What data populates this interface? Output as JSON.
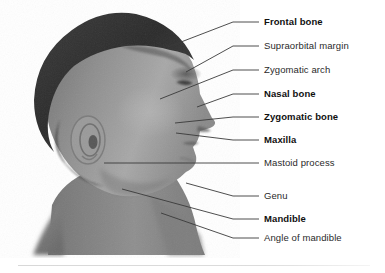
{
  "figure": {
    "photo_alt": "male-head-right-profile-grayscale"
  },
  "labels": [
    {
      "id": "frontal-bone",
      "text": "Frontal bone",
      "weight": "bold",
      "y": 22,
      "line": {
        "x1": 168,
        "y1": 47,
        "x2": 233,
        "y2": 22,
        "x3": 259,
        "y3": 22
      }
    },
    {
      "id": "supraorbital-margin",
      "text": "Supraorbital margin",
      "weight": "regular",
      "y": 46,
      "line": {
        "x1": 186,
        "y1": 72,
        "x2": 233,
        "y2": 46,
        "x3": 259,
        "y3": 46
      }
    },
    {
      "id": "zygomatic-arch",
      "text": "Zygomatic arch",
      "weight": "regular",
      "y": 70,
      "line": {
        "x1": 160,
        "y1": 99,
        "x2": 233,
        "y2": 70,
        "x3": 259,
        "y3": 70
      }
    },
    {
      "id": "nasal-bone",
      "text": "Nasal bone",
      "weight": "bold",
      "y": 94,
      "line": {
        "x1": 197,
        "y1": 107,
        "x2": 233,
        "y2": 94,
        "x3": 259,
        "y3": 94
      }
    },
    {
      "id": "zygomatic-bone",
      "text": "Zygomatic bone",
      "weight": "bold",
      "y": 117,
      "line": {
        "x1": 175,
        "y1": 123,
        "x2": 233,
        "y2": 117,
        "x3": 259,
        "y3": 117
      }
    },
    {
      "id": "maxilla",
      "text": "Maxilla",
      "weight": "bold",
      "y": 140,
      "line": {
        "x1": 176,
        "y1": 133,
        "x2": 233,
        "y2": 140,
        "x3": 259,
        "y3": 140
      }
    },
    {
      "id": "mastoid-process",
      "text": "Mastoid process",
      "weight": "regular",
      "y": 163,
      "line": {
        "x1": 104,
        "y1": 163,
        "x2": 233,
        "y2": 163,
        "x3": 259,
        "y3": 163
      }
    },
    {
      "id": "genu",
      "text": "Genu",
      "weight": "regular",
      "y": 196,
      "line": {
        "x1": 186,
        "y1": 183,
        "x2": 233,
        "y2": 196,
        "x3": 259,
        "y3": 196
      }
    },
    {
      "id": "mandible",
      "text": "Mandible",
      "weight": "bold",
      "y": 219,
      "line": {
        "x1": 122,
        "y1": 189,
        "x2": 233,
        "y2": 219,
        "x3": 259,
        "y3": 219
      }
    },
    {
      "id": "angle-of-mandible",
      "text": "Angle of mandible",
      "weight": "regular",
      "y": 238,
      "line": {
        "x1": 161,
        "y1": 213,
        "x2": 233,
        "y2": 238,
        "x3": 259,
        "y3": 238
      }
    }
  ],
  "colors": {
    "leader_line": "#3a3a3a",
    "label_text": "#1d1d1d",
    "divider": "#dcdcdc",
    "background": "#ffffff"
  },
  "divider": {
    "visible": true
  }
}
